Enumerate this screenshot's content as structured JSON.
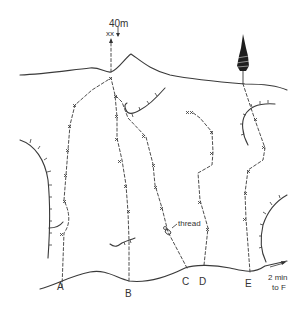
{
  "diagram": {
    "type": "climbing-topo",
    "top_label": "40m",
    "anchor_label": "xx",
    "feature_label": "thread",
    "approach_note_line1": "2 min",
    "approach_note_line2": "to F",
    "routes": [
      {
        "label": "A",
        "x": 62,
        "y": 289
      },
      {
        "label": "B",
        "x": 129,
        "y": 296
      },
      {
        "label": "C",
        "x": 187,
        "y": 285
      },
      {
        "label": "D",
        "x": 204,
        "y": 285
      },
      {
        "label": "E",
        "x": 250,
        "y": 287
      }
    ],
    "colors": {
      "ink": "#3a3a3a",
      "background": "#ffffff"
    }
  }
}
